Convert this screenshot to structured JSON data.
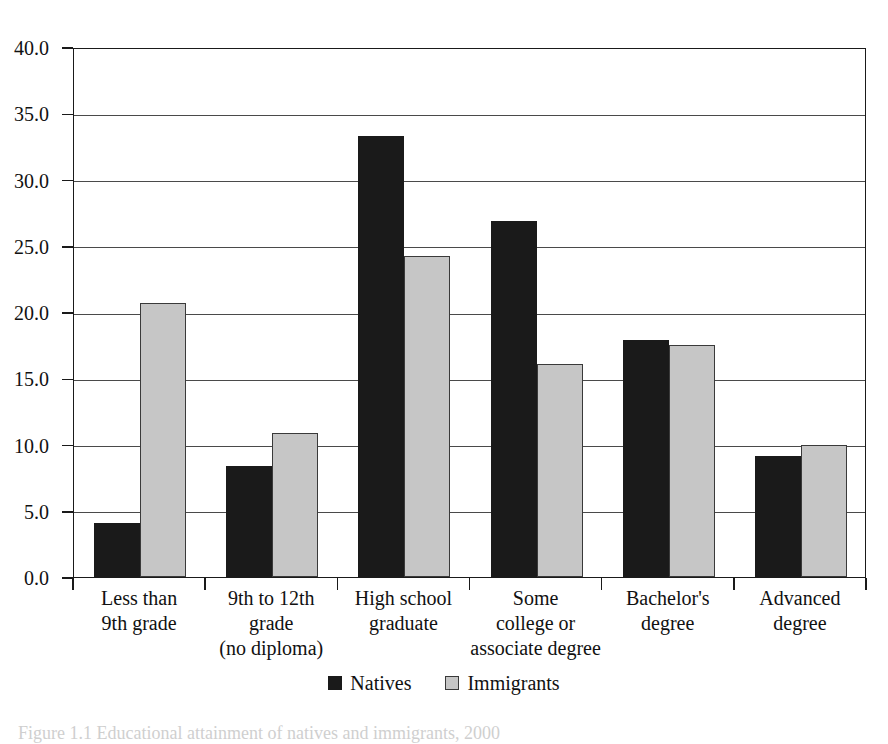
{
  "chart_data": {
    "type": "bar",
    "title": "",
    "xlabel": "",
    "ylabel": "",
    "ylim": [
      0,
      40
    ],
    "ytick_step": 5,
    "ytick_labels": [
      "0.0",
      "5.0",
      "10.0",
      "15.0",
      "20.0",
      "25.0",
      "30.0",
      "35.0",
      "40.0"
    ],
    "ytick_values": [
      0,
      5,
      10,
      15,
      20,
      25,
      30,
      35,
      40
    ],
    "grid": "horizontal",
    "legend_position": "bottom-center",
    "categories": [
      "Less than\n9th grade",
      "9th to 12th\ngrade\n(no diploma)",
      "High school\ngraduate",
      "Some\ncollege or\nassociate degree",
      "Bachelor's\ndegree",
      "Advanced\ndegree"
    ],
    "category_lines": [
      [
        "Less than",
        "9th grade"
      ],
      [
        "9th to 12th",
        "grade",
        "(no diploma)"
      ],
      [
        "High school",
        "graduate"
      ],
      [
        "Some",
        "college or",
        "associate degree"
      ],
      [
        "Bachelor's",
        "degree"
      ],
      [
        "Advanced",
        "degree"
      ]
    ],
    "series": [
      {
        "name": "Natives",
        "color": "#1a1a1a",
        "values": [
          4.1,
          8.4,
          33.3,
          26.9,
          17.9,
          9.1
        ]
      },
      {
        "name": "Immigrants",
        "color": "#c6c6c6",
        "values": [
          20.7,
          10.9,
          24.2,
          16.1,
          17.5,
          10.0
        ]
      }
    ]
  },
  "legend": {
    "entries": [
      {
        "label": "Natives",
        "swatch": "black-square-icon"
      },
      {
        "label": "Immigrants",
        "swatch": "gray-square-icon"
      }
    ]
  },
  "caption": {
    "text": "Figure 1.1  Educational attainment of natives and immigrants, 2000"
  }
}
